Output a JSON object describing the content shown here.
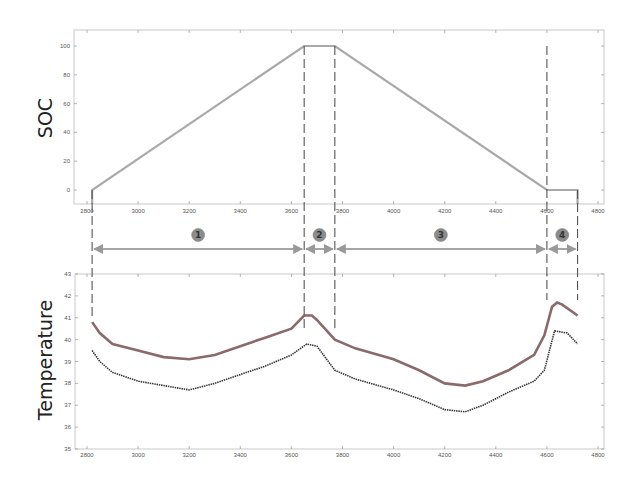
{
  "chart_data": [
    {
      "type": "line",
      "title": "",
      "ylabel": "SOC",
      "xlabel": "",
      "xlim": [
        2780,
        4800
      ],
      "ylim": [
        -10,
        110
      ],
      "xticks": [
        2800,
        3000,
        3200,
        3400,
        3600,
        3800,
        4000,
        4200,
        4400,
        4600,
        4800
      ],
      "yticks": [
        0,
        20,
        40,
        60,
        80,
        100
      ],
      "grid": false,
      "series": [
        {
          "name": "SOC",
          "color": "#a9a9a9",
          "x": [
            2820,
            2820,
            3650,
            3770,
            4600,
            4720,
            4720
          ],
          "y": [
            -10,
            0,
            100,
            100,
            0,
            0,
            -10
          ]
        }
      ]
    },
    {
      "type": "line",
      "title": "",
      "ylabel": "Temperature",
      "xlabel": "",
      "xlim": [
        2780,
        4800
      ],
      "ylim": [
        35,
        43
      ],
      "xticks": [
        2800,
        3000,
        3200,
        3400,
        3600,
        3800,
        4000,
        4200,
        4400,
        4600,
        4800
      ],
      "yticks": [
        35,
        36,
        37,
        38,
        39,
        40,
        41,
        42,
        43
      ],
      "grid": false,
      "series": [
        {
          "name": "Temperature (upper)",
          "color": "#8a6a6a",
          "x": [
            2820,
            2850,
            2900,
            3000,
            3100,
            3200,
            3300,
            3400,
            3500,
            3600,
            3650,
            3680,
            3700,
            3770,
            3850,
            4000,
            4100,
            4200,
            4280,
            4350,
            4450,
            4550,
            4590,
            4620,
            4640,
            4660,
            4720
          ],
          "y": [
            40.8,
            40.3,
            39.8,
            39.5,
            39.2,
            39.1,
            39.3,
            39.7,
            40.1,
            40.5,
            41.1,
            41.1,
            40.9,
            40.0,
            39.6,
            39.1,
            38.6,
            38.0,
            37.9,
            38.1,
            38.6,
            39.3,
            40.2,
            41.5,
            41.7,
            41.6,
            41.1
          ]
        },
        {
          "name": "Temperature (lower)",
          "color": "#3a3a3a",
          "x": [
            2820,
            2850,
            2900,
            3000,
            3100,
            3200,
            3300,
            3400,
            3500,
            3600,
            3660,
            3700,
            3770,
            3850,
            4000,
            4100,
            4200,
            4280,
            4350,
            4450,
            4550,
            4590,
            4610,
            4630,
            4680,
            4720
          ],
          "y": [
            39.5,
            39.0,
            38.5,
            38.1,
            37.9,
            37.7,
            38.0,
            38.4,
            38.8,
            39.3,
            39.8,
            39.7,
            38.6,
            38.2,
            37.7,
            37.3,
            36.8,
            36.7,
            37.0,
            37.6,
            38.1,
            38.6,
            39.5,
            40.4,
            40.3,
            39.8
          ]
        }
      ],
      "annotations": {
        "phase_boundaries_x": [
          2820,
          3650,
          3770,
          4600,
          4720
        ],
        "phases": [
          {
            "label": "1",
            "x_start": 2820,
            "x_end": 3650
          },
          {
            "label": "2",
            "x_start": 3650,
            "x_end": 3770
          },
          {
            "label": "3",
            "x_start": 3770,
            "x_end": 4600
          },
          {
            "label": "4",
            "x_start": 4600,
            "x_end": 4720
          }
        ]
      }
    }
  ],
  "labels": {
    "soc_axis": "SOC",
    "temperature_axis": "Temperature",
    "phase_1": "1",
    "phase_2": "2",
    "phase_3": "3",
    "phase_4": "4"
  }
}
